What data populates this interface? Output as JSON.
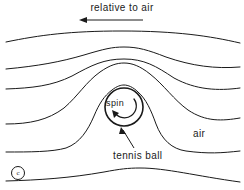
{
  "figure": {
    "title": "relative to air",
    "background_color": "#ffffff",
    "line_color": "#1a1a1a",
    "width": 244,
    "height": 190
  },
  "labels": {
    "title": "relative to air",
    "spin": "spin",
    "air": "air",
    "tennis_ball": "tennis ball",
    "copyright": "c"
  },
  "icons": {
    "flow_arrow": "left-arrow-icon",
    "spin_arrow": "curved-spin-arrow-icon",
    "leader_arrow": "leader-arrow-icon",
    "copyright": "copyright-icon"
  },
  "chart_data": {
    "type": "line",
    "title": "relative to air",
    "xlabel": "",
    "ylabel": "",
    "xlim": [
      0,
      244
    ],
    "ylim": [
      190,
      0
    ],
    "grid": false,
    "legend": null,
    "annotations": [
      {
        "text": "relative to air",
        "x": 122,
        "y": 8,
        "role": "title"
      },
      {
        "text": "spin",
        "x": 119,
        "y": 103,
        "role": "inline-label"
      },
      {
        "text": "air",
        "x": 201,
        "y": 134,
        "role": "inline-label"
      },
      {
        "text": "tennis ball",
        "x": 139,
        "y": 156,
        "role": "callout-label"
      },
      {
        "text": "c",
        "x": 17,
        "y": 172,
        "role": "copyright"
      }
    ],
    "flow_direction_arrow": {
      "from": [
        143,
        20
      ],
      "to": [
        80,
        20
      ],
      "label": "relative to air"
    },
    "ball": {
      "cx": 124,
      "cy": 107,
      "r": 19,
      "label": "tennis ball",
      "spin_label": "spin",
      "spin_direction": "counterclockwise"
    },
    "series": [
      {
        "name": "streamline-1",
        "path": "M 6,42 C 40,35 70,31 122,31 C 176,31 210,36 240,43"
      },
      {
        "name": "streamline-2",
        "path": "M 6,69 C 38,66 60,62 84,55 C 104,49 112,47 124,47 C 138,47 148,50 166,57 C 192,66 215,69 240,67"
      },
      {
        "name": "streamline-3",
        "path": "M 6,89 C 32,88 52,86 72,76 C 92,65 104,59 124,59 C 144,59 156,66 174,78 C 196,90 218,91 240,88"
      },
      {
        "name": "streamline-4",
        "path": "M 6,124 C 30,124 48,120 64,108 C 78,96 86,82 100,72 C 110,65 117,63 124,63 C 132,63 140,66 150,74 C 164,85 174,100 188,110 C 206,122 222,121 240,118"
      },
      {
        "name": "streamline-5",
        "path": "M 6,152 C 30,152 52,152 66,148 C 80,143 88,130 94,116 C 99,104 104,96 112,90 C 117,86 121,85 124,85 C 128,85 133,87 138,92 C 146,99 151,110 156,124 C 162,140 172,149 186,151 C 208,154 222,153 240,151"
      },
      {
        "name": "streamline-6",
        "path": "M 6,181 C 40,180 70,178 104,172 C 120,169 128,168 140,168 C 166,168 196,176 240,182"
      }
    ]
  }
}
